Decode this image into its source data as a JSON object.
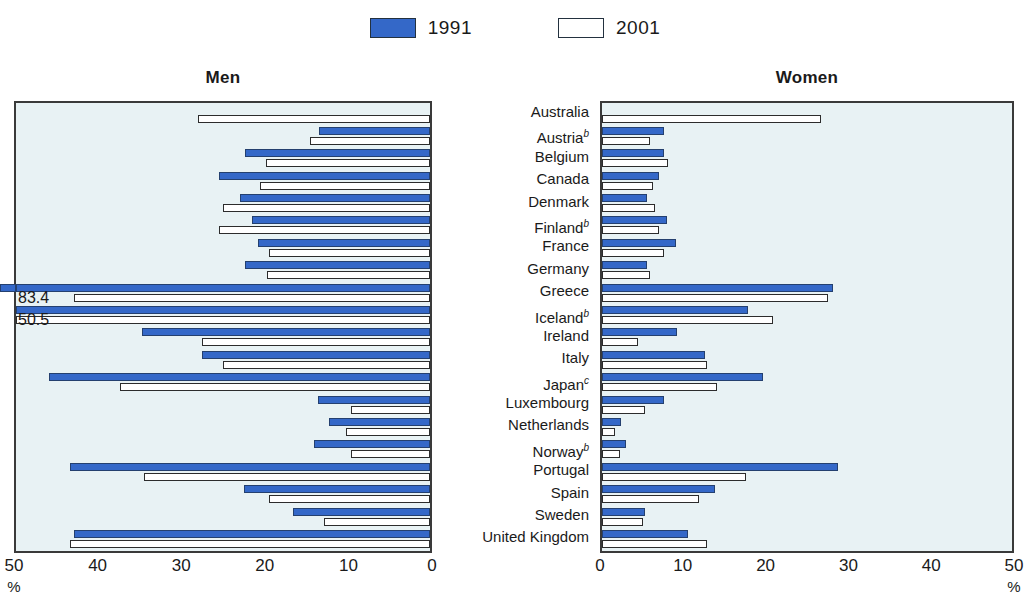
{
  "legend": {
    "entries": [
      {
        "label": "1991",
        "swatch": "filled-blue-swatch",
        "color": "#3468c8"
      },
      {
        "label": "2001",
        "swatch": "open-white-swatch",
        "color": "#ffffff"
      }
    ]
  },
  "panels": {
    "men": {
      "title": "Men",
      "axis_ticks": [
        "50",
        "40",
        "30",
        "20",
        "10",
        "0"
      ],
      "unit": "%",
      "direction": "right-to-left",
      "axis_min": 0,
      "axis_max": 50
    },
    "women": {
      "title": "Women",
      "axis_ticks": [
        "0",
        "10",
        "20",
        "30",
        "40",
        "50"
      ],
      "unit": "%",
      "direction": "left-to-right",
      "axis_min": 0,
      "axis_max": 50
    }
  },
  "countries": [
    {
      "name": "Australia",
      "note": ""
    },
    {
      "name": "Austria",
      "note": "b"
    },
    {
      "name": "Belgium",
      "note": ""
    },
    {
      "name": "Canada",
      "note": ""
    },
    {
      "name": "Denmark",
      "note": ""
    },
    {
      "name": "Finland",
      "note": "b"
    },
    {
      "name": "France",
      "note": ""
    },
    {
      "name": "Germany",
      "note": ""
    },
    {
      "name": "Greece",
      "note": ""
    },
    {
      "name": "Iceland",
      "note": "b"
    },
    {
      "name": "Ireland",
      "note": ""
    },
    {
      "name": "Italy",
      "note": ""
    },
    {
      "name": "Japan",
      "note": "c"
    },
    {
      "name": "Luxembourg",
      "note": ""
    },
    {
      "name": "Netherlands",
      "note": ""
    },
    {
      "name": "Norway",
      "note": "b"
    },
    {
      "name": "Portugal",
      "note": ""
    },
    {
      "name": "Spain",
      "note": ""
    },
    {
      "name": "Sweden",
      "note": ""
    },
    {
      "name": "United Kingdom",
      "note": ""
    }
  ],
  "annotations": [
    {
      "text": "83.4",
      "panel": "men",
      "country": "Greece",
      "series": "1991"
    },
    {
      "text": "50.5",
      "panel": "men",
      "country": "Greece",
      "series": "2001"
    }
  ],
  "chart_data": {
    "type": "bar",
    "title": "",
    "subtitle": "",
    "xlabel": "%",
    "ylabel": "",
    "orientation": "horizontal",
    "grid": false,
    "legend_position": "top-center",
    "panels": [
      "Men",
      "Women"
    ],
    "categories": [
      "Australia",
      "Austria",
      "Belgium",
      "Canada",
      "Denmark",
      "Finland",
      "France",
      "Germany",
      "Greece",
      "Iceland",
      "Ireland",
      "Italy",
      "Japan",
      "Luxembourg",
      "Netherlands",
      "Norway",
      "Portugal",
      "Spain",
      "Sweden",
      "United Kingdom"
    ],
    "men": {
      "xlim": [
        0,
        50
      ],
      "axis_reversed": true,
      "series": [
        {
          "name": "1991",
          "color": "#3468c8",
          "values": [
            null,
            13.4,
            22.3,
            25.5,
            23.0,
            21.5,
            20.8,
            22.4,
            58.8,
            83.4,
            34.8,
            27.5,
            46.0,
            13.5,
            12.2,
            14.0,
            43.5,
            22.5,
            16.5,
            43.0
          ]
        },
        {
          "name": "2001",
          "color": "#ffffff",
          "values": [
            28.0,
            14.5,
            19.8,
            20.5,
            25.0,
            25.5,
            19.5,
            19.7,
            43.0,
            50.5,
            27.5,
            25.0,
            37.5,
            9.5,
            10.2,
            9.5,
            34.5,
            19.5,
            12.8,
            43.5
          ]
        }
      ]
    },
    "women": {
      "xlim": [
        0,
        50
      ],
      "axis_reversed": false,
      "series": [
        {
          "name": "1991",
          "color": "#3468c8",
          "values": [
            null,
            7.5,
            7.6,
            7.0,
            5.5,
            7.9,
            9.0,
            5.5,
            28.2,
            17.8,
            9.2,
            12.5,
            19.6,
            7.6,
            2.3,
            2.9,
            28.8,
            13.8,
            5.2,
            10.5
          ]
        },
        {
          "name": "2001",
          "color": "#ffffff",
          "values": [
            26.7,
            5.8,
            8.0,
            6.2,
            6.5,
            7.0,
            7.5,
            5.8,
            27.5,
            20.8,
            4.4,
            12.8,
            14.0,
            5.2,
            1.6,
            2.2,
            17.5,
            11.8,
            5.0,
            12.8
          ]
        }
      ]
    }
  }
}
